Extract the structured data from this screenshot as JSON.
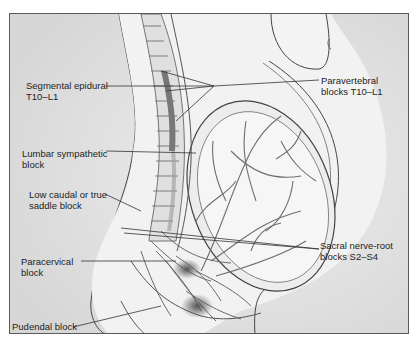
{
  "figure": {
    "background": "#d9d9d9",
    "frame_color": "#5a5a5a",
    "line_color": "#333333",
    "labels": {
      "segmental_epidural": {
        "line1": "Segmental epidural",
        "line2": "T10–L1"
      },
      "paravertebral": {
        "line1": "Paravertebral",
        "line2": "blocks T10–L1"
      },
      "lumbar_sympathetic": {
        "line1": "Lumbar sympathetic",
        "line2": "block"
      },
      "low_caudal": {
        "line1": "Low caudal or true",
        "line2": "saddle block"
      },
      "sacral_nerve_root": {
        "line1": "Sacral nerve-root",
        "line2": "blocks S2–S4"
      },
      "paracervical": {
        "line1": "Paracervical",
        "line2": "block"
      },
      "pudendal": {
        "line1": "Pudendal block"
      }
    }
  }
}
